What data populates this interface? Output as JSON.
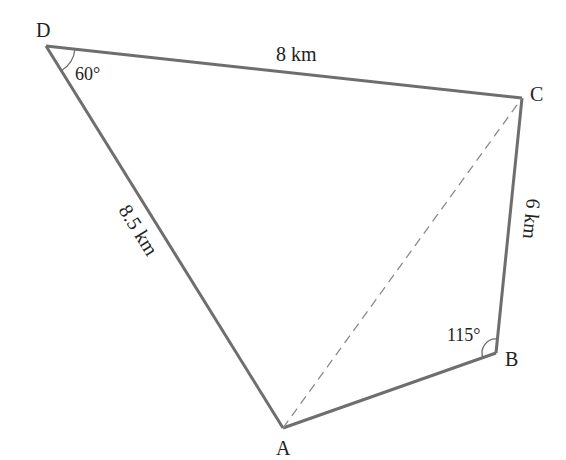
{
  "diagram": {
    "type": "quadrilateral",
    "vertices": {
      "A": {
        "label": "A",
        "x": 283,
        "y": 428
      },
      "B": {
        "label": "B",
        "x": 496,
        "y": 353
      },
      "C": {
        "label": "C",
        "x": 522,
        "y": 98
      },
      "D": {
        "label": "D",
        "x": 46,
        "y": 46
      }
    },
    "sides": {
      "DC": {
        "label": "8 km"
      },
      "CB": {
        "label": "6 km"
      },
      "DA": {
        "label": "8.5 km"
      }
    },
    "angles": {
      "D": {
        "label": "60°"
      },
      "B": {
        "label": "115°"
      }
    },
    "diagonal": {
      "from": "A",
      "to": "C",
      "style": "dashed"
    },
    "colors": {
      "line": "#6e6e6e",
      "text": "#222222"
    }
  }
}
